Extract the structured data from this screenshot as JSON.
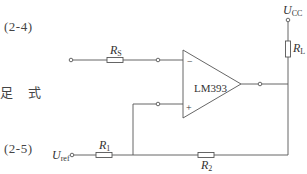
{
  "page_text": {
    "equation_ref_top": "(2-4)",
    "chinese_fragment": "足 式",
    "equation_ref_bottom": "(2-5)"
  },
  "circuit": {
    "comparator": {
      "label": "LM393",
      "inverting_pin": "−",
      "noninverting_pin": "+"
    },
    "components": {
      "rs": {
        "name": "R",
        "sub": "S"
      },
      "r1": {
        "name": "R",
        "sub": "1"
      },
      "r2": {
        "name": "R",
        "sub": "2"
      },
      "rl": {
        "name": "R",
        "sub": "L"
      }
    },
    "nodes": {
      "supply": {
        "name": "U",
        "sub": "CC"
      },
      "reference": {
        "name": "U",
        "sub": "ref"
      }
    },
    "colors": {
      "wire": "#555555",
      "background": "#ffffff"
    }
  }
}
